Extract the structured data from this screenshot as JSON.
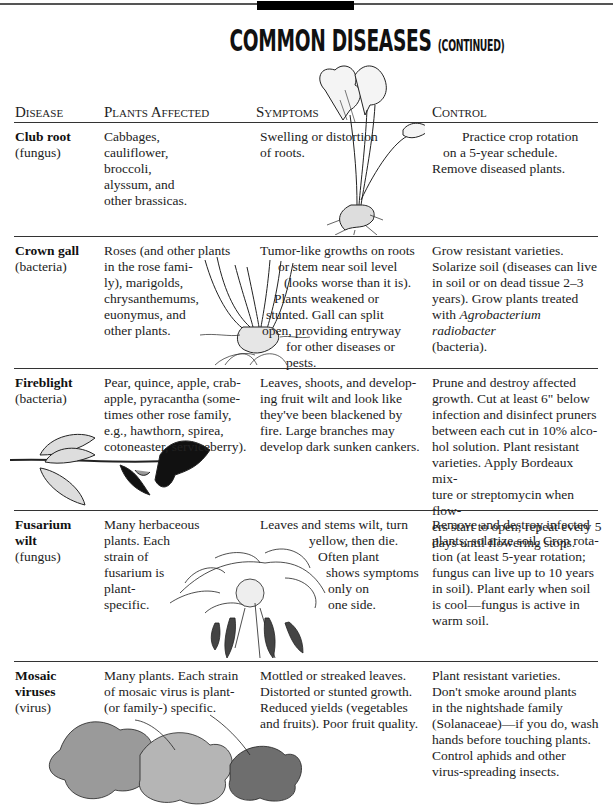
{
  "page": {
    "title": "Common Diseases",
    "title_suffix": "(continued)"
  },
  "table": {
    "headers": {
      "disease": "Disease",
      "plants": "Plants Affected",
      "symptoms": "Symptoms",
      "control": "Control"
    },
    "rows": [
      {
        "disease": "Club root",
        "type": "(fungus)",
        "plants": [
          "Cabbages,",
          "cauliflower,",
          "broccoli,",
          "alyssum, and",
          "other brassicas."
        ],
        "symptoms": [
          "Swelling or distortion",
          "of roots."
        ],
        "control": [
          "Practice crop rotation",
          "on a 5-year schedule.",
          "Remove diseased plants."
        ],
        "illustration": "club-root-plant"
      },
      {
        "disease": "Crown gall",
        "type": "(bacteria)",
        "plants": [
          "Roses (and other plants",
          "in the rose fami-",
          "ly), marigolds,",
          "chrysanthemums,",
          "euonymus, and",
          "other plants."
        ],
        "symptoms": [
          "Tumor-like growths on roots",
          "or stem near soil level",
          "(looks worse than it is).",
          "Plants weakened or",
          "stunted. Gall can split",
          "open, providing entryway",
          "for other diseases or",
          "pests."
        ],
        "control_pre": "Grow resistant varieties. Solarize soil (diseases can live in soil or on dead tissue 2–3 years). Grow plants treated with ",
        "control_italic": "Agrobacterium radiobacter",
        "control_post": " (bacteria).",
        "control": [
          "Grow resistant varieties.",
          "Solarize soil (diseases can live",
          "in soil or on dead tissue 2–3",
          "years). Grow plants treated",
          "with",
          "Agrobacterium radiobacter",
          "(bacteria)."
        ],
        "illustration": "rose-crown-gall"
      },
      {
        "disease": "Fireblight",
        "type": "(bacteria)",
        "plants": [
          "Pear, quince, apple, crab-",
          "apple, pyracantha (some-",
          "times other rose family,",
          "e.g., hawthorn, spirea,",
          "cotoneaster, serviceberry)."
        ],
        "symptoms": [
          "Leaves, shoots, and develop-",
          "ing fruit wilt and look like",
          "they've been blackened by",
          "fire. Large branches may",
          "develop dark sunken cankers."
        ],
        "control": [
          "Prune and destroy affected",
          "growth. Cut at least 6\" below",
          "infection and disinfect pruners",
          "between each cut in 10% alco-",
          "hol solution. Plant resistant",
          "varieties. Apply Bordeaux mix-",
          "ture or streptomycin when flow-",
          "ers start to open; repeat every 5",
          "days until flowering stops."
        ],
        "illustration": "fireblight-branch"
      },
      {
        "disease": "Fusarium",
        "disease2": "wilt",
        "type": "(fungus)",
        "plants": [
          "Many herbaceous",
          "plants. Each",
          "strain of",
          "fusarium is",
          "plant-",
          "specific."
        ],
        "symptoms": [
          "Leaves and stems wilt, turn",
          "yellow, then die.",
          "Often plant",
          "shows symptoms",
          "only on",
          "one side."
        ],
        "control": [
          "Remove and destroy infected",
          "plants; solarize soil. Crop rota-",
          "tion (at least 5-year rotation;",
          "fungus can live up to 10 years",
          "in soil). Plant early when soil",
          "is cool—fungus is active in",
          "warm soil."
        ],
        "illustration": "wilted-tomato-plant"
      },
      {
        "disease": "Mosaic",
        "disease2": "viruses",
        "type": "(virus)",
        "plants": [
          "Many plants. Each strain",
          "of mosaic virus is plant-",
          "(or family-) specific."
        ],
        "symptoms": [
          "Mottled or streaked leaves.",
          "Distorted or stunted growth.",
          "Reduced yields (vegetables",
          "and fruits). Poor fruit quality."
        ],
        "control": [
          "Plant resistant varieties.",
          "Don't smoke around plants",
          "in the nightshade family",
          "(Solanaceae)—if you do, wash",
          "hands before touching plants.",
          "Control aphids and other",
          "virus-spreading insects."
        ],
        "illustration": "mosaic-leaves"
      }
    ]
  }
}
